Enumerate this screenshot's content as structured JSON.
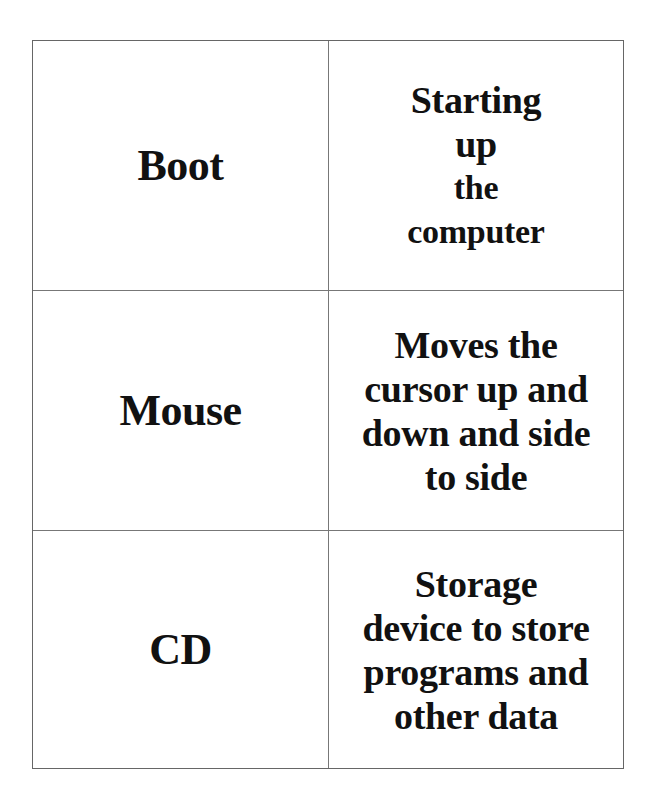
{
  "document": {
    "type": "vocabulary-cards",
    "rows": [
      {
        "term": "Boot",
        "definition_lines": [
          "Starting",
          "up",
          "the",
          "computer"
        ]
      },
      {
        "term": "Mouse",
        "definition_lines": [
          "Moves the",
          "cursor up and",
          "down and side",
          "to side"
        ]
      },
      {
        "term": "CD",
        "definition_lines": [
          "Storage",
          "device to store",
          "programs and",
          "other data"
        ]
      }
    ]
  },
  "colors": {
    "text": "#111111",
    "border": "#666666",
    "background": "#ffffff"
  }
}
